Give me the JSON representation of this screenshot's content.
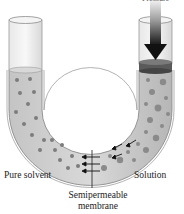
{
  "figure": {
    "labels": {
      "pressure": "Pressure",
      "pure_solvent": "Pure solvent",
      "solution": "Solution",
      "membrane_line1": "Semipermeable",
      "membrane_line2": "membrane"
    }
  },
  "colors": {
    "tube_glass": "#cfcfcf",
    "liquid": "#bdbdbd",
    "particle": "#7a7a7a",
    "piston": "#555555",
    "arrow": "#1a1a1a"
  }
}
